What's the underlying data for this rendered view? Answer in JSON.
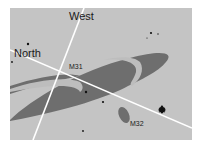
{
  "figure": {
    "type": "sky-chart",
    "labels": {
      "west": "West",
      "north": "North",
      "m31": "M31",
      "m32": "M32"
    },
    "colors": {
      "sky": "#c4c4c4",
      "galaxy": "#6e6e6e",
      "lane": "#bdbdbd",
      "axes": "#ffffff",
      "stars": "#111111"
    },
    "axes": [
      {
        "name": "west-line",
        "direction": "West"
      },
      {
        "name": "north-line",
        "direction": "North"
      }
    ],
    "objects": [
      "M31",
      "M32"
    ]
  }
}
